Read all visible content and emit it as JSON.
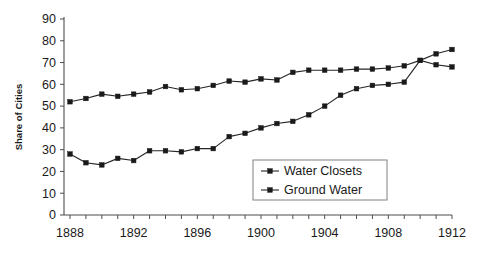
{
  "chart_data": {
    "type": "line",
    "title": "",
    "xlabel": "",
    "ylabel": "Share of Cities",
    "xlim": [
      1888,
      1912
    ],
    "ylim": [
      0,
      90
    ],
    "yticks": [
      0,
      10,
      20,
      30,
      40,
      50,
      60,
      70,
      80,
      90
    ],
    "xticks_labeled": [
      1888,
      1892,
      1896,
      1900,
      1904,
      1908,
      1912
    ],
    "xticks_all": [
      1888,
      1889,
      1890,
      1891,
      1892,
      1893,
      1894,
      1895,
      1896,
      1897,
      1898,
      1899,
      1900,
      1901,
      1902,
      1903,
      1904,
      1905,
      1906,
      1907,
      1908,
      1909,
      1910,
      1911,
      1912
    ],
    "grid": false,
    "legend_position": "center-right-inside",
    "x": [
      1888,
      1889,
      1890,
      1891,
      1892,
      1893,
      1894,
      1895,
      1896,
      1897,
      1898,
      1899,
      1900,
      1901,
      1902,
      1903,
      1904,
      1905,
      1906,
      1907,
      1908,
      1909,
      1910,
      1911,
      1912
    ],
    "series": [
      {
        "name": "Water Closets",
        "marker": "square",
        "color": "#1a1a1a",
        "values": [
          28,
          24,
          23,
          26,
          25,
          29.5,
          29.5,
          29,
          30.5,
          30.5,
          36,
          37.5,
          40,
          42,
          43,
          46,
          50,
          55,
          58,
          59.5,
          60,
          61,
          71,
          74,
          76
        ]
      },
      {
        "name": "Ground Water",
        "marker": "square",
        "color": "#1a1a1a",
        "values": [
          52,
          53.5,
          55.5,
          54.5,
          55.5,
          56.5,
          59,
          57.5,
          58,
          59.5,
          61.5,
          61,
          62.5,
          62,
          65.5,
          66.5,
          66.5,
          66.5,
          67,
          67,
          67.5,
          68.5,
          71,
          69,
          68
        ]
      }
    ]
  },
  "legend": {
    "items": [
      {
        "label": "Water Closets"
      },
      {
        "label": "Ground Water"
      }
    ]
  },
  "axes": {
    "y_title": "Share of Cities"
  }
}
